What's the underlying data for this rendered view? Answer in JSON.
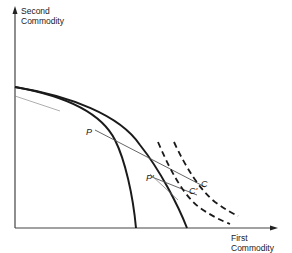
{
  "axes": {
    "y_label_line1": "Second",
    "y_label_line2": "Commodity",
    "x_label_line1": "First",
    "x_label_line2": "Commodity"
  },
  "points": {
    "p": "P",
    "p_prime": "P'",
    "c": "C",
    "c_prime": "C'"
  },
  "colors": {
    "ink": "#1a1a1a",
    "thin_line": "#555555",
    "background": "#ffffff"
  }
}
